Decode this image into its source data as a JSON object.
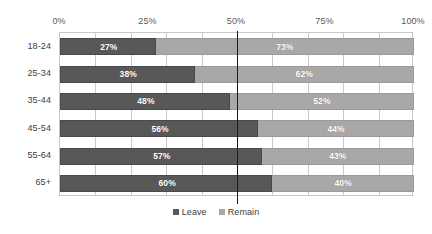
{
  "chart_data": {
    "type": "bar",
    "orientation": "horizontal",
    "stacked": true,
    "normalized": true,
    "title": "",
    "subtitle": "",
    "xlabel": "",
    "ylabel": "",
    "xlim": [
      0,
      100
    ],
    "xtick_labels": [
      "0%",
      "25%",
      "50%",
      "75%",
      "100%"
    ],
    "xtick_values": [
      0,
      25,
      50,
      75,
      100
    ],
    "gridline_interval": 10,
    "grid": true,
    "legend_position": "bottom-center",
    "categories": [
      "18-24",
      "25-34",
      "35-44",
      "45-54",
      "55-64",
      "65+"
    ],
    "series": [
      {
        "name": "Leave",
        "color": "#585858",
        "values": [
          27,
          38,
          48,
          56,
          57,
          60
        ],
        "labels": [
          "27%",
          "38%",
          "48%",
          "56%",
          "57%",
          "60%"
        ]
      },
      {
        "name": "Remain",
        "color": "#a8a8a8",
        "values": [
          73,
          62,
          52,
          44,
          43,
          40
        ],
        "labels": [
          "73%",
          "62%",
          "52%",
          "44%",
          "43%",
          "40%"
        ]
      }
    ],
    "annotations": [
      {
        "type": "vertical-line",
        "name": "fifty-percent-threshold",
        "value": 50,
        "color": "#1a1a1a"
      }
    ]
  },
  "legend": {
    "items": [
      {
        "label": "Leave",
        "color": "#585858"
      },
      {
        "label": "Remain",
        "color": "#a8a8a8"
      }
    ]
  }
}
